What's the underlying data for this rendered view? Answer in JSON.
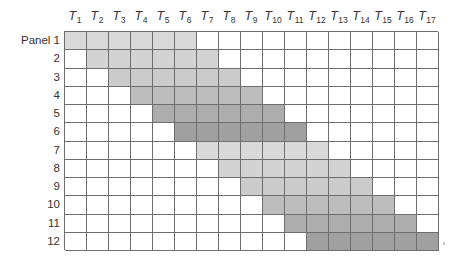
{
  "diagram": {
    "type": "panel-time-schedule-grid",
    "row_label_prefix": "Panel",
    "column_prefix": "T",
    "columns": [
      {
        "id": 1,
        "label": "T",
        "sub": "1"
      },
      {
        "id": 2,
        "label": "T",
        "sub": "2"
      },
      {
        "id": 3,
        "label": "T",
        "sub": "3"
      },
      {
        "id": 4,
        "label": "T",
        "sub": "4"
      },
      {
        "id": 5,
        "label": "T",
        "sub": "5"
      },
      {
        "id": 6,
        "label": "T",
        "sub": "6"
      },
      {
        "id": 7,
        "label": "T",
        "sub": "7"
      },
      {
        "id": 8,
        "label": "T",
        "sub": "8"
      },
      {
        "id": 9,
        "label": "T",
        "sub": "9"
      },
      {
        "id": 10,
        "label": "T",
        "sub": "10"
      },
      {
        "id": 11,
        "label": "T",
        "sub": "11"
      },
      {
        "id": 12,
        "label": "T",
        "sub": "12"
      },
      {
        "id": 13,
        "label": "T",
        "sub": "13"
      },
      {
        "id": 14,
        "label": "T",
        "sub": "14"
      },
      {
        "id": 15,
        "label": "T",
        "sub": "15"
      },
      {
        "id": 16,
        "label": "T",
        "sub": "16"
      },
      {
        "id": 17,
        "label": "T",
        "sub": "17"
      }
    ],
    "rows": [
      {
        "label": "Panel 1",
        "start": 1,
        "end": 6,
        "shade": "#d9d9d9"
      },
      {
        "label": "2",
        "start": 2,
        "end": 7,
        "shade": "#d3d3d3"
      },
      {
        "label": "3",
        "start": 3,
        "end": 8,
        "shade": "#cbcbcb"
      },
      {
        "label": "4",
        "start": 4,
        "end": 9,
        "shade": "#bdbdbd"
      },
      {
        "label": "5",
        "start": 5,
        "end": 10,
        "shade": "#adadad"
      },
      {
        "label": "6",
        "start": 6,
        "end": 11,
        "shade": "#a0a0a0"
      },
      {
        "label": "7",
        "start": 7,
        "end": 12,
        "shade": "#d9d9d9"
      },
      {
        "label": "8",
        "start": 8,
        "end": 13,
        "shade": "#d3d3d3"
      },
      {
        "label": "9",
        "start": 9,
        "end": 14,
        "shade": "#cbcbcb"
      },
      {
        "label": "10",
        "start": 10,
        "end": 15,
        "shade": "#bdbdbd"
      },
      {
        "label": "11",
        "start": 11,
        "end": 16,
        "shade": "#adadad"
      },
      {
        "label": "12",
        "start": 12,
        "end": 17,
        "shade": "#a0a0a0"
      }
    ],
    "colors": {
      "grid_line": "#6e6e6e",
      "empty_cell": "#ffffff",
      "text": "#333333"
    }
  }
}
